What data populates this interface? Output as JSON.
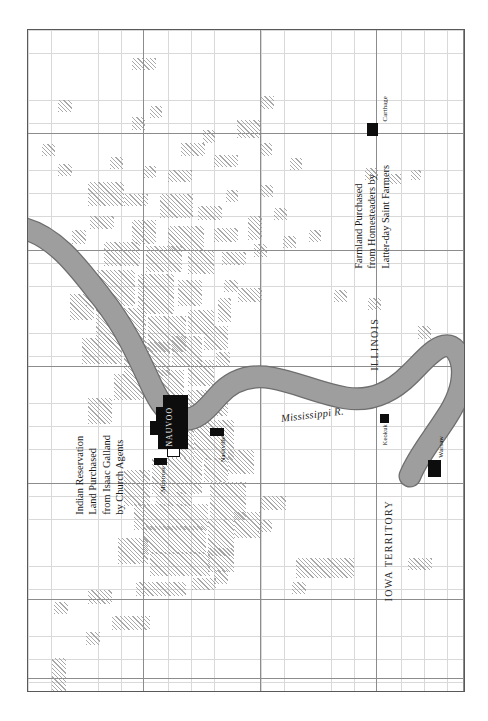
{
  "map": {
    "title": "Nauvoo and Vicinity Land Holdings",
    "river": {
      "name": "Mississippi R.",
      "color": "#9a9a9a"
    },
    "regions": [
      {
        "id": "illinois",
        "label": "ILLINOIS"
      },
      {
        "id": "iowa",
        "label": "IOWA TERRITORY"
      }
    ],
    "towns": [
      {
        "id": "nauvoo",
        "label": "NAUVOO"
      },
      {
        "id": "montrose",
        "label": "Montrose"
      },
      {
        "id": "nashville",
        "label": "Nashville"
      },
      {
        "id": "keokuk",
        "label": "Keokuk"
      },
      {
        "id": "warsaw",
        "label": "Warsaw"
      },
      {
        "id": "carthage",
        "label": "Carthage"
      }
    ],
    "annotations": {
      "left": {
        "id": "indian-reservation-note",
        "lines": [
          "Indian Reservation",
          "Land Purchased",
          "from Isaac Galland",
          "by Church Agents"
        ]
      },
      "right": {
        "id": "farmland-note",
        "lines": [
          "Farmland Purchased",
          "from Homesteaders by",
          "Latter-day Saint Farmers"
        ]
      }
    },
    "colors": {
      "town_fill": "#0d0d0d",
      "hatch": "#9a9a9a",
      "river_fill": "#9a9a9a",
      "river_stroke": "#6e6e6e",
      "grid_fine": "#d9d9d9",
      "grid_major": "#8c8c8c",
      "neatline": "#595959",
      "background": "#ffffff"
    },
    "grid": {
      "fine_spacing_px": 23.3,
      "major_spacing_px": 116.5,
      "visible": true
    }
  }
}
